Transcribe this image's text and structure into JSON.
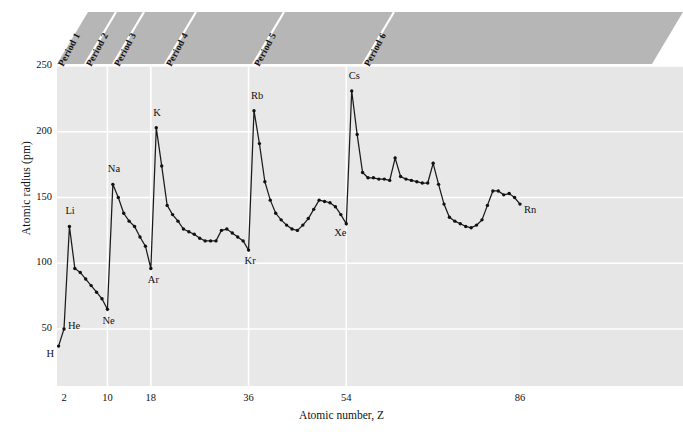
{
  "figure": {
    "xlabel": "Atomic number, Z",
    "ylabel": "Atomic radius (pm)",
    "background": "#e8e8e8",
    "band_color": "#b6b6b6",
    "line_color": "#1a1a1a"
  },
  "bands": [
    {
      "label": "Period 1"
    },
    {
      "label": "Period 2"
    },
    {
      "label": "Period 3"
    },
    {
      "label": "Period 4"
    },
    {
      "label": "Period 5"
    },
    {
      "label": "Period 6"
    }
  ],
  "chart_data": {
    "type": "line",
    "title": "",
    "xlabel": "Atomic number, Z",
    "ylabel": "Atomic radius (pm)",
    "xlim": [
      1,
      86
    ],
    "ylim": [
      0,
      250
    ],
    "xticks": [
      2,
      10,
      18,
      36,
      54,
      86
    ],
    "yticks": [
      50,
      100,
      150,
      200,
      250
    ],
    "grid": true,
    "legend": "none",
    "marker": "dot",
    "series": [
      {
        "name": "Atomic radius",
        "x": [
          1,
          2,
          3,
          4,
          5,
          6,
          7,
          8,
          9,
          10,
          11,
          12,
          13,
          14,
          15,
          16,
          17,
          18,
          19,
          20,
          21,
          22,
          23,
          24,
          25,
          26,
          27,
          28,
          29,
          30,
          31,
          32,
          33,
          34,
          35,
          36,
          37,
          38,
          39,
          40,
          41,
          42,
          43,
          44,
          45,
          46,
          47,
          48,
          49,
          50,
          51,
          52,
          53,
          54,
          55,
          56,
          57,
          58,
          59,
          60,
          61,
          62,
          63,
          64,
          65,
          66,
          67,
          68,
          69,
          70,
          71,
          72,
          73,
          74,
          75,
          76,
          77,
          78,
          79,
          80,
          81,
          82,
          83,
          84,
          85,
          86
        ],
        "values": [
          37,
          50,
          128,
          96,
          93,
          88,
          83,
          78,
          73,
          65,
          160,
          150,
          138,
          132,
          128,
          120,
          113,
          96,
          203,
          174,
          144,
          137,
          132,
          126,
          124,
          122,
          119,
          117,
          117,
          117,
          125,
          126,
          123,
          120,
          117,
          110,
          216,
          191,
          162,
          148,
          138,
          133,
          129,
          126,
          125,
          129,
          134,
          141,
          148,
          147,
          146,
          143,
          137,
          130,
          231,
          198,
          169,
          165,
          165,
          164,
          164,
          163,
          180,
          166,
          164,
          163,
          162,
          161,
          161,
          176,
          160,
          145,
          135,
          132,
          130,
          128,
          127,
          129,
          133,
          144,
          155,
          155,
          152,
          153,
          150,
          145
        ]
      }
    ],
    "annotations": [
      {
        "label": "H",
        "x": 1,
        "y": 37
      },
      {
        "label": "He",
        "x": 2,
        "y": 50
      },
      {
        "label": "Li",
        "x": 3,
        "y": 128
      },
      {
        "label": "Ne",
        "x": 10,
        "y": 65
      },
      {
        "label": "Na",
        "x": 11,
        "y": 160
      },
      {
        "label": "Ar",
        "x": 18,
        "y": 96
      },
      {
        "label": "K",
        "x": 19,
        "y": 203
      },
      {
        "label": "Kr",
        "x": 36,
        "y": 110
      },
      {
        "label": "Rb",
        "x": 37,
        "y": 216
      },
      {
        "label": "Xe",
        "x": 54,
        "y": 130
      },
      {
        "label": "Cs",
        "x": 55,
        "y": 231
      },
      {
        "label": "Rn",
        "x": 86,
        "y": 145
      }
    ]
  }
}
